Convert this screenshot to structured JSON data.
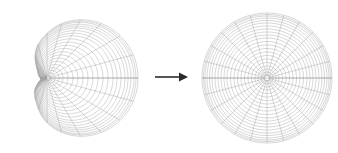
{
  "figure": {
    "background_color": "#ffffff",
    "line_color": "#9a9a9a",
    "arrow_color": "#2b2b2b",
    "width": 338,
    "height": 153
  },
  "panels": [
    {
      "id": "left-panel",
      "name": "distorted-polar-grid",
      "label": "",
      "center_x": 47,
      "center_y": 78,
      "n_rings": 22,
      "n_spokes": 24,
      "max_radius": 91,
      "distortion": "cardioid",
      "description": "Polar grid distorted by a conformal map; rings crowd into scalloped petals on the left of the focus"
    },
    {
      "id": "right-panel",
      "name": "regular-polar-grid",
      "label": "",
      "center_x": 267,
      "center_y": 78,
      "n_rings": 22,
      "n_spokes": 24,
      "max_radius": 65,
      "distortion": "none",
      "description": "Undistorted concentric circles with evenly spaced radial spokes"
    }
  ],
  "arrow": {
    "name": "transform-arrow",
    "label": "",
    "x1": 155,
    "y1": 77,
    "x2": 188,
    "y2": 77,
    "direction": "right",
    "color": "#2b2b2b"
  },
  "chart_data": {
    "type": "scatter",
    "title": "",
    "xlabel": "",
    "ylabel": "",
    "legend": [],
    "grid": true,
    "series": [
      {
        "name": "left-grid-rings",
        "count": 22,
        "radii": [
          4,
          8,
          12,
          16,
          21,
          26,
          31,
          36,
          41,
          46,
          51,
          56,
          61,
          66,
          70,
          74,
          78,
          81,
          84,
          87,
          89,
          91
        ]
      },
      {
        "name": "left-grid-spokes",
        "count": 24,
        "angles_deg": [
          0,
          15,
          30,
          45,
          60,
          75,
          90,
          105,
          120,
          135,
          150,
          165,
          180,
          195,
          210,
          225,
          240,
          255,
          270,
          285,
          300,
          315,
          330,
          345
        ]
      },
      {
        "name": "right-grid-rings",
        "count": 22,
        "radii": [
          3,
          6,
          9,
          12,
          15.5,
          19,
          22.5,
          26,
          29.5,
          33,
          36.5,
          40,
          43,
          46,
          49,
          52,
          55,
          57.5,
          60,
          62,
          63.5,
          65
        ]
      },
      {
        "name": "right-grid-spokes",
        "count": 24,
        "angles_deg": [
          0,
          15,
          30,
          45,
          60,
          75,
          90,
          105,
          120,
          135,
          150,
          165,
          180,
          195,
          210,
          225,
          240,
          255,
          270,
          285,
          300,
          315,
          330,
          345
        ]
      }
    ]
  }
}
